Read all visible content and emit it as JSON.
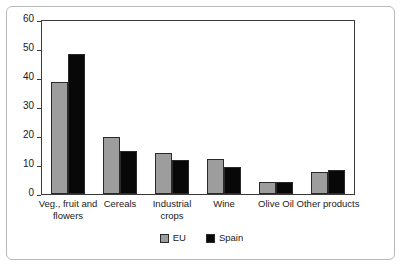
{
  "chart_data": {
    "type": "bar",
    "title": "",
    "subtitle": "",
    "xlabel": "",
    "ylabel": "",
    "ylim": [
      0,
      60
    ],
    "yticks": [
      0,
      10,
      20,
      30,
      40,
      50,
      60
    ],
    "grid": false,
    "legend_position": "bottom",
    "categories": [
      "Veg., fruit and flowers",
      "Cereals",
      "Industrial crops",
      "Wine",
      "Olive Oil",
      "Other products"
    ],
    "series": [
      {
        "name": "EU",
        "color": "#9d9d9d",
        "values": [
          39.0,
          19.8,
          14.3,
          12.0,
          4.2,
          7.7
        ]
      },
      {
        "name": "Spain",
        "color": "#080808",
        "values": [
          48.5,
          15.0,
          11.7,
          9.3,
          4.2,
          8.5
        ]
      }
    ]
  },
  "axis": {
    "y_tick_labels": [
      "0",
      "10",
      "20",
      "30",
      "40",
      "50",
      "60"
    ]
  },
  "legend": {
    "items": [
      {
        "label": "EU",
        "swatch": "gray-swatch"
      },
      {
        "label": "Spain",
        "swatch": "black-swatch"
      }
    ]
  }
}
